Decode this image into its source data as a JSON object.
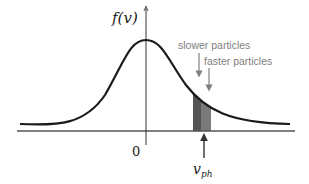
{
  "diagram": {
    "y_axis_label": "f(v)",
    "origin_label": "0",
    "marker_label_main": "v",
    "marker_label_sub": "ph",
    "annotations": [
      {
        "text": "slower particles"
      },
      {
        "text": "faster particles"
      }
    ],
    "colors": {
      "curve": "#1a1a1a",
      "axis": "#333333",
      "annotation": "#808080",
      "shade_dark": "#555555",
      "shade_light": "#7a7a7a"
    }
  }
}
